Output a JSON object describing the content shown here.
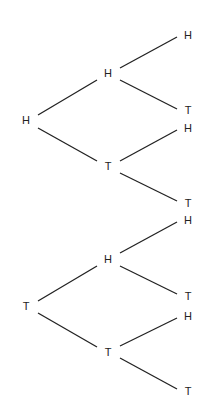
{
  "diagram": {
    "type": "probability-tree",
    "nodes": [
      {
        "id": "n1",
        "label": "H",
        "x": 26,
        "y": 120
      },
      {
        "id": "n2",
        "label": "H",
        "x": 108,
        "y": 73
      },
      {
        "id": "n3",
        "label": "T",
        "x": 108,
        "y": 166
      },
      {
        "id": "n4",
        "label": "H",
        "x": 188,
        "y": 35
      },
      {
        "id": "n5",
        "label": "T",
        "x": 188,
        "y": 110
      },
      {
        "id": "n6",
        "label": "H",
        "x": 188,
        "y": 128
      },
      {
        "id": "n7",
        "label": "T",
        "x": 188,
        "y": 203
      },
      {
        "id": "n8",
        "label": "T",
        "x": 26,
        "y": 306
      },
      {
        "id": "n9",
        "label": "H",
        "x": 108,
        "y": 259
      },
      {
        "id": "n10",
        "label": "T",
        "x": 108,
        "y": 352
      },
      {
        "id": "n11",
        "label": "H",
        "x": 188,
        "y": 220
      },
      {
        "id": "n12",
        "label": "T",
        "x": 188,
        "y": 296
      },
      {
        "id": "n13",
        "label": "H",
        "x": 188,
        "y": 316
      },
      {
        "id": "n14",
        "label": "T",
        "x": 188,
        "y": 391
      }
    ],
    "edges": [
      [
        38,
        115,
        97,
        80
      ],
      [
        38,
        128,
        97,
        161
      ],
      [
        120,
        68,
        177,
        37
      ],
      [
        120,
        80,
        177,
        109
      ],
      [
        120,
        161,
        177,
        130
      ],
      [
        120,
        173,
        177,
        201
      ],
      [
        38,
        301,
        97,
        266
      ],
      [
        38,
        313,
        97,
        347
      ],
      [
        120,
        253,
        177,
        222
      ],
      [
        120,
        266,
        177,
        294
      ],
      [
        120,
        346,
        177,
        318
      ],
      [
        120,
        358,
        177,
        389
      ]
    ]
  }
}
